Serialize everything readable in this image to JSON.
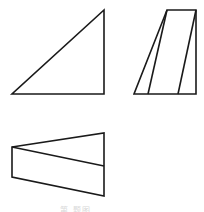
{
  "diagram": {
    "stroke_color": "#1a1a1a",
    "views": [
      {
        "name": "front-view",
        "shape": "right-triangle",
        "points": [
          [
            12,
            94
          ],
          [
            104,
            94
          ],
          [
            104,
            10
          ]
        ]
      },
      {
        "name": "side-view",
        "shape": "trapezoid-with-internal-lines",
        "outline": [
          [
            134,
            94
          ],
          [
            196,
            94
          ],
          [
            196,
            10
          ],
          [
            167,
            10
          ]
        ],
        "internal_lines": [
          [
            [
              148,
              94
            ],
            [
              167,
              10
            ]
          ],
          [
            [
              178,
              94
            ],
            [
              196,
              10
            ]
          ]
        ]
      },
      {
        "name": "top-view",
        "shape": "quadrilateral-with-diagonal",
        "outline": [
          [
            12,
            147
          ],
          [
            104,
            133
          ],
          [
            104,
            196
          ],
          [
            12,
            177
          ]
        ],
        "internal_lines": [
          [
            [
              12,
              147
            ],
            [
              104,
              166
            ]
          ]
        ]
      }
    ],
    "caption": "第 题图"
  }
}
